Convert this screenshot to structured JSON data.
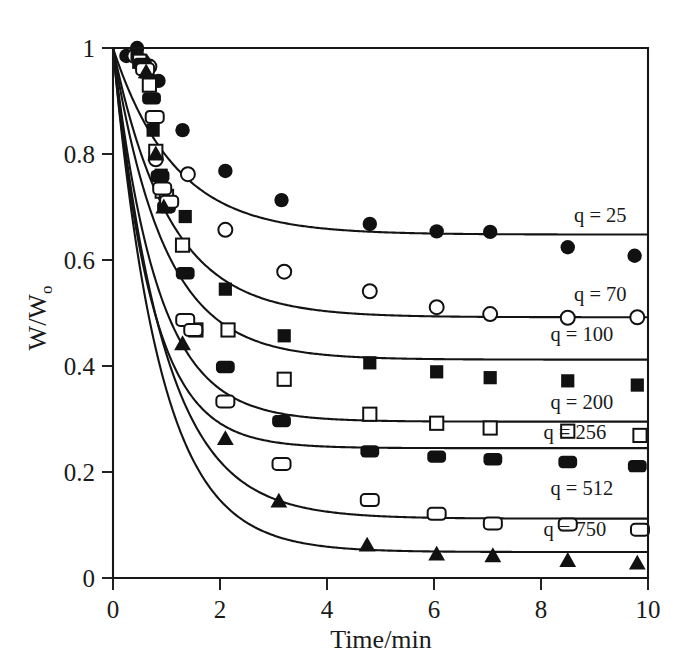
{
  "figure": {
    "background_color": "#ffffff",
    "ink_color": "#111111"
  },
  "axes": {
    "x": {
      "title": "Time/min",
      "ticks": [
        "0",
        "2",
        "4",
        "6",
        "8",
        "10"
      ],
      "tick_values": [
        0,
        2,
        4,
        6,
        8,
        10
      ],
      "min": 0,
      "max": 10
    },
    "y": {
      "title_main": "W/W",
      "title_subscript": "o",
      "title_full": "W/Wo",
      "ticks": [
        "0",
        "0.2",
        "0.4",
        "0.6",
        "0.8",
        "1"
      ],
      "tick_values": [
        0,
        0.2,
        0.4,
        0.6,
        0.8,
        1.0
      ],
      "min": 0,
      "max": 1.0
    }
  },
  "series_labels": [
    {
      "text": "q = 25",
      "x": 9.6,
      "y": 0.672
    },
    {
      "text": "q = 70",
      "x": 9.6,
      "y": 0.523
    },
    {
      "text": "q = 100",
      "x": 9.35,
      "y": 0.447
    },
    {
      "text": "q = 200",
      "x": 9.35,
      "y": 0.318
    },
    {
      "text": "q = 256",
      "x": 9.22,
      "y": 0.262
    },
    {
      "text": "q = 512",
      "x": 9.35,
      "y": 0.157
    },
    {
      "text": "q = 750",
      "x": 9.22,
      "y": 0.079
    }
  ],
  "chart_data": {
    "type": "scatter",
    "title": "",
    "subtitle": "",
    "xlabel": "Time/min",
    "ylabel": "W/Wo",
    "xlim": [
      0,
      10
    ],
    "ylim": [
      0,
      1.0
    ],
    "grid": false,
    "legend_position": "inline-right-of-curves",
    "x_ticks": [
      0,
      2,
      4,
      6,
      8,
      10
    ],
    "y_ticks": [
      0,
      0.2,
      0.4,
      0.6,
      0.8,
      1.0
    ],
    "annotations": [
      "q = 25",
      "q = 70",
      "q = 100",
      "q = 200",
      "q = 256",
      "q = 512",
      "q = 750"
    ],
    "series": [
      {
        "name": "q = 25",
        "label": "q = 25",
        "marker": "filled-circle",
        "plateau": 0.648,
        "fit": {
          "model": "A + (1-A)*exp(-t/tau)",
          "A": 0.648,
          "tau": 1.15
        },
        "points": [
          {
            "x": 0.25,
            "y": 0.985
          },
          {
            "x": 0.45,
            "y": 1.0
          },
          {
            "x": 0.7,
            "y": 0.94
          },
          {
            "x": 0.85,
            "y": 0.938
          },
          {
            "x": 1.3,
            "y": 0.845
          },
          {
            "x": 2.1,
            "y": 0.768
          },
          {
            "x": 3.15,
            "y": 0.713
          },
          {
            "x": 4.8,
            "y": 0.668
          },
          {
            "x": 6.05,
            "y": 0.654
          },
          {
            "x": 7.05,
            "y": 0.653
          },
          {
            "x": 8.5,
            "y": 0.624
          },
          {
            "x": 9.75,
            "y": 0.608
          }
        ]
      },
      {
        "name": "q = 70",
        "label": "q = 70",
        "marker": "open-circle",
        "plateau": 0.492,
        "fit": {
          "model": "A + (1-A)*exp(-t/tau)",
          "A": 0.492,
          "tau": 1.05
        },
        "points": [
          {
            "x": 0.4,
            "y": 0.985
          },
          {
            "x": 0.55,
            "y": 0.975
          },
          {
            "x": 0.68,
            "y": 0.965
          },
          {
            "x": 0.8,
            "y": 0.79
          },
          {
            "x": 0.95,
            "y": 0.735
          },
          {
            "x": 1.4,
            "y": 0.762
          },
          {
            "x": 2.1,
            "y": 0.657
          },
          {
            "x": 3.2,
            "y": 0.578
          },
          {
            "x": 4.8,
            "y": 0.541
          },
          {
            "x": 6.05,
            "y": 0.511
          },
          {
            "x": 7.05,
            "y": 0.498
          },
          {
            "x": 8.5,
            "y": 0.491
          },
          {
            "x": 9.8,
            "y": 0.492
          }
        ]
      },
      {
        "name": "q = 100",
        "label": "q = 100",
        "marker": "filled-square",
        "plateau": 0.412,
        "fit": {
          "model": "A + (1-A)*exp(-t/tau)",
          "A": 0.412,
          "tau": 0.95
        },
        "points": [
          {
            "x": 0.45,
            "y": 0.988
          },
          {
            "x": 0.62,
            "y": 0.955
          },
          {
            "x": 0.75,
            "y": 0.845
          },
          {
            "x": 0.9,
            "y": 0.76
          },
          {
            "x": 1.35,
            "y": 0.682
          },
          {
            "x": 2.1,
            "y": 0.545
          },
          {
            "x": 3.2,
            "y": 0.457
          },
          {
            "x": 4.8,
            "y": 0.406
          },
          {
            "x": 6.05,
            "y": 0.389
          },
          {
            "x": 7.05,
            "y": 0.378
          },
          {
            "x": 8.5,
            "y": 0.372
          },
          {
            "x": 9.8,
            "y": 0.364
          }
        ]
      },
      {
        "name": "q = 200",
        "label": "q = 200",
        "marker": "open-square",
        "plateau": 0.295,
        "fit": {
          "model": "A + (1-A)*exp(-t/tau)",
          "A": 0.295,
          "tau": 0.82
        },
        "points": [
          {
            "x": 0.5,
            "y": 0.975
          },
          {
            "x": 0.68,
            "y": 0.93
          },
          {
            "x": 0.8,
            "y": 0.805
          },
          {
            "x": 0.92,
            "y": 0.73
          },
          {
            "x": 1.0,
            "y": 0.72
          },
          {
            "x": 1.3,
            "y": 0.628
          },
          {
            "x": 1.55,
            "y": 0.468
          },
          {
            "x": 2.15,
            "y": 0.468
          },
          {
            "x": 3.2,
            "y": 0.375
          },
          {
            "x": 4.8,
            "y": 0.309
          },
          {
            "x": 6.05,
            "y": 0.292
          },
          {
            "x": 7.05,
            "y": 0.283
          },
          {
            "x": 8.5,
            "y": 0.277
          },
          {
            "x": 9.85,
            "y": 0.269
          }
        ]
      },
      {
        "name": "q = 256",
        "label": "q = 256",
        "marker": "filled-rounded-rect",
        "plateau": 0.245,
        "fit": {
          "model": "A + (1-A)*exp(-t/tau)",
          "A": 0.245,
          "tau": 0.72
        },
        "points": [
          {
            "x": 0.55,
            "y": 0.97
          },
          {
            "x": 0.72,
            "y": 0.905
          },
          {
            "x": 0.88,
            "y": 0.758
          },
          {
            "x": 1.0,
            "y": 0.7
          },
          {
            "x": 1.35,
            "y": 0.575
          },
          {
            "x": 2.1,
            "y": 0.398
          },
          {
            "x": 3.15,
            "y": 0.296
          },
          {
            "x": 4.8,
            "y": 0.239
          },
          {
            "x": 6.05,
            "y": 0.229
          },
          {
            "x": 7.1,
            "y": 0.224
          },
          {
            "x": 8.5,
            "y": 0.219
          },
          {
            "x": 9.8,
            "y": 0.211
          }
        ]
      },
      {
        "name": "q = 512",
        "label": "q = 512",
        "marker": "open-rounded-rect",
        "plateau": 0.112,
        "fit": {
          "model": "A + (1-A)*exp(-t/tau)",
          "A": 0.112,
          "tau": 0.95
        },
        "points": [
          {
            "x": 0.6,
            "y": 0.96
          },
          {
            "x": 0.78,
            "y": 0.87
          },
          {
            "x": 0.92,
            "y": 0.735
          },
          {
            "x": 1.05,
            "y": 0.71
          },
          {
            "x": 1.35,
            "y": 0.487
          },
          {
            "x": 1.5,
            "y": 0.468
          },
          {
            "x": 2.1,
            "y": 0.333
          },
          {
            "x": 3.15,
            "y": 0.215
          },
          {
            "x": 4.8,
            "y": 0.147
          },
          {
            "x": 6.05,
            "y": 0.121
          },
          {
            "x": 7.1,
            "y": 0.103
          },
          {
            "x": 8.5,
            "y": 0.101
          },
          {
            "x": 9.85,
            "y": 0.091
          }
        ]
      },
      {
        "name": "q = 750",
        "label": "q = 750",
        "marker": "filled-triangle",
        "plateau": 0.049,
        "fit": {
          "model": "A + (1-A)*exp(-t/tau)",
          "A": 0.049,
          "tau": 0.88
        },
        "points": [
          {
            "x": 0.62,
            "y": 0.955
          },
          {
            "x": 0.8,
            "y": 0.8
          },
          {
            "x": 0.95,
            "y": 0.7
          },
          {
            "x": 1.3,
            "y": 0.442
          },
          {
            "x": 2.1,
            "y": 0.263
          },
          {
            "x": 3.1,
            "y": 0.145
          },
          {
            "x": 4.75,
            "y": 0.062
          },
          {
            "x": 6.05,
            "y": 0.045
          },
          {
            "x": 7.1,
            "y": 0.042
          },
          {
            "x": 8.5,
            "y": 0.033
          },
          {
            "x": 9.8,
            "y": 0.028
          }
        ]
      }
    ]
  }
}
